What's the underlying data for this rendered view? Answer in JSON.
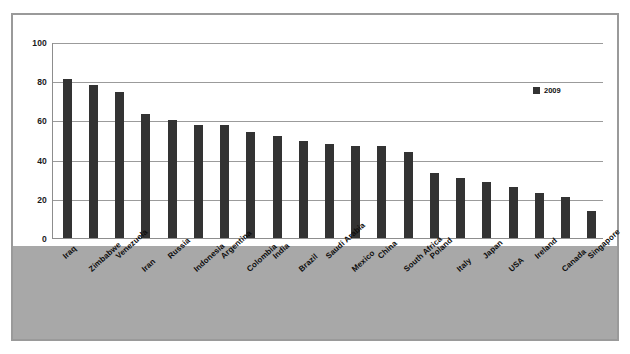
{
  "chart_data": {
    "type": "bar",
    "title": "",
    "xlabel": "",
    "ylabel": "",
    "ylim": [
      0,
      100
    ],
    "yticks": [
      0,
      20,
      40,
      60,
      80,
      100
    ],
    "grid": true,
    "legend_position": "top-right",
    "series": [
      {
        "name": "2009",
        "color": "#333333",
        "values": [
          81,
          78,
          74.5,
          63.5,
          60,
          57.5,
          57.5,
          54,
          52,
          49.5,
          48,
          47,
          47,
          44,
          33,
          30.5,
          28.5,
          26,
          23,
          21,
          14
        ]
      }
    ],
    "categories": [
      "Iraq",
      "Zimbabwe",
      "Venezuela",
      "Iran",
      "Russia",
      "Indonesia",
      "Argentina",
      "Colombia",
      "India",
      "Brazil",
      "Saudi Arabia",
      "Mexico",
      "China",
      "South Africa",
      "Poland",
      "Italy",
      "Japan",
      "USA",
      "Ireland",
      "Canada",
      "Singapore"
    ]
  },
  "legend": {
    "label": "2009"
  },
  "colors": {
    "bar": "#333333",
    "gridline": "#9b9b9b",
    "band": "#a8a8a8",
    "frame": "#9a9a9a",
    "axis": "#8d8d8d"
  }
}
